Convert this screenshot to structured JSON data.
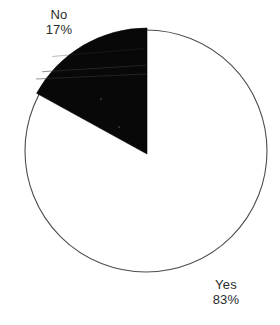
{
  "chart_data": {
    "type": "pie",
    "title": "",
    "categories": [
      "Yes",
      "No"
    ],
    "values": [
      83,
      17
    ],
    "value_unit": "%",
    "labels": [
      "Yes\n83%",
      "No\n17%"
    ],
    "legend": "none",
    "grid": false,
    "slices": [
      {
        "name": "Yes",
        "value": 83,
        "value_label": "83%",
        "color": "#ffffff",
        "outline_color": "#4d4d4d",
        "start_angle_deg": 0,
        "end_angle_deg": 298.8,
        "label_position": "bottom-right"
      },
      {
        "name": "No",
        "value": 17,
        "value_label": "17%",
        "color": "#080808",
        "outline_color": "#080808",
        "start_angle_deg": 298.8,
        "end_angle_deg": 360,
        "label_position": "top-left"
      }
    ]
  },
  "labels": {
    "no": {
      "name": "No",
      "value": "17%"
    },
    "yes": {
      "name": "Yes",
      "value": "83%"
    }
  },
  "colors": {
    "background": "#ffffff",
    "slice_dark": "#080808",
    "slice_light": "#ffffff",
    "outline": "#4d4d4d",
    "text": "#2b2b2b"
  },
  "geometry": {
    "center_x": 146,
    "center_y": 151,
    "radius": 121,
    "wedge_apex_x": 147,
    "wedge_apex_y": 154,
    "wedge_radius": 126
  }
}
